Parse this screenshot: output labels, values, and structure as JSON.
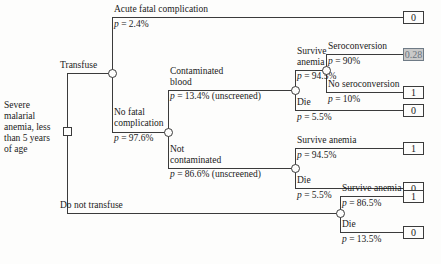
{
  "diagram": {
    "type": "decision-tree",
    "root": {
      "node_type": "decision",
      "label": "Severe malarial anemia, less than 5 years of age"
    },
    "colors": {
      "line": "#3b3b3b",
      "text": "#1a1a1a",
      "background": "#fdfdfc",
      "highlight_fill": "#c9c9c9",
      "highlight_text": "#6a7480"
    },
    "branches": {
      "transfuse": "Transfuse",
      "do_not_transfuse": "Do not transfuse",
      "acute_fatal": "Acute fatal complication",
      "acute_fatal_p": "p = 2.4%",
      "no_fatal": "No fatal complication",
      "no_fatal_p": "p = 97.6%",
      "contaminated": "Contaminated blood",
      "contaminated_p": "p = 13.4% (unscreened)",
      "not_contaminated": "Not contaminated",
      "not_contaminated_p": "p = 86.6% (unscreened)",
      "survive_anemia_1": "Survive anemia",
      "survive_anemia_1_p": "p = 94.5%",
      "die_1": "Die",
      "die_1_p": "p = 5.5%",
      "seroconversion": "Seroconversion",
      "seroconversion_p": "p = 90%",
      "no_seroconversion": "No seroconversion",
      "no_seroconversion_p": "p = 10%",
      "survive_anemia_2": "Survive anemia",
      "survive_anemia_2_p": "p = 94.5%",
      "die_2": "Die",
      "die_2_p": "p = 5.5%",
      "survive_anemia_3": "Survive anemia",
      "survive_anemia_3_p": "p = 86.5%",
      "die_3": "Die",
      "die_3_p": "p = 13.5%"
    },
    "terminals": {
      "acute_fatal_payoff": "0",
      "seroconversion_payoff": "0.28",
      "no_seroconversion_payoff": "1",
      "die_contaminated_payoff": "0",
      "survive_not_contaminated_payoff": "1",
      "die_not_contaminated_payoff": "0",
      "survive_no_transfuse_payoff": "1",
      "die_no_transfuse_payoff": "0"
    }
  }
}
